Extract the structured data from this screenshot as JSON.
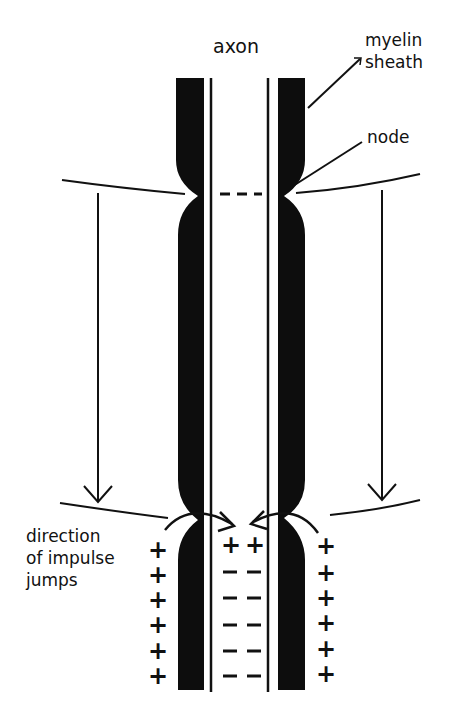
{
  "diagram": {
    "type": "saltatory-conduction",
    "labels": {
      "axon": "axon",
      "myelin_line1": "myelin",
      "myelin_line2": "sheath",
      "node": "node",
      "direction_line1": "direction",
      "direction_line2": "of impulse",
      "direction_line3": "jumps"
    },
    "signs": {
      "plus": "+",
      "minus": "–"
    },
    "outer_left_plus_count": 6,
    "outer_right_plus_count": 6,
    "inner_top_row": [
      "+",
      "+"
    ],
    "inner_minus_rows": 5,
    "colors": {
      "ink": "#111111",
      "sheath": "#0d0d0d",
      "background": "#ffffff"
    }
  }
}
